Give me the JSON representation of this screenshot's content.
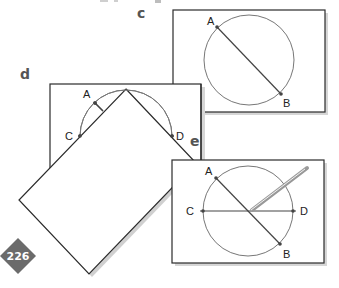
{
  "figure": {
    "panels": {
      "c": {
        "label": "c",
        "points": {
          "A": "A",
          "B": "B"
        }
      },
      "d": {
        "label": "d",
        "points": {
          "A": "A",
          "C": "C",
          "D": "D"
        }
      },
      "e": {
        "label": "e",
        "points": {
          "A": "A",
          "B": "B",
          "C": "C",
          "D": "D"
        }
      }
    },
    "page_number": "226"
  },
  "colors": {
    "line": "#2b2b2b",
    "circle": "#777777",
    "shadow": "#c8c8c8",
    "badge": "#6b6b6b",
    "label": "#555555"
  }
}
